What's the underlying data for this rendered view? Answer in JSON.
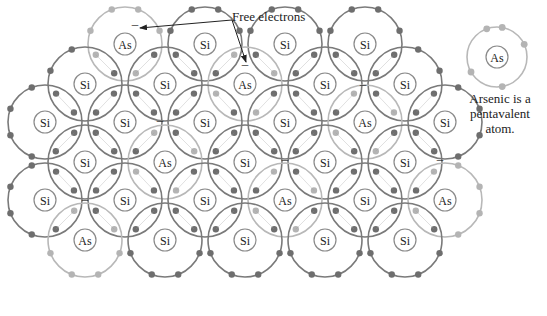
{
  "diagram": {
    "labels": {
      "free_electrons": "Free electrons",
      "caption_line1": "Arsenic is a",
      "caption_line2": "pentavalent",
      "caption_line3": "atom."
    },
    "colors": {
      "si_orbit": "#7a7a7a",
      "as_orbit": "#b8b8b8",
      "si_electron": "#6e6e6e",
      "as_electron": "#b4b4b4",
      "nucleus_stroke": "#8a8a8a",
      "text": "#222222"
    },
    "orbit_radius": 37,
    "nucleus_radius": 11,
    "atoms": [
      {
        "el": "As",
        "x": 125,
        "y": 44
      },
      {
        "el": "Si",
        "x": 205,
        "y": 44
      },
      {
        "el": "Si",
        "x": 285,
        "y": 44
      },
      {
        "el": "Si",
        "x": 365,
        "y": 44
      },
      {
        "el": "Si",
        "x": 85,
        "y": 84
      },
      {
        "el": "Si",
        "x": 165,
        "y": 84
      },
      {
        "el": "As",
        "x": 245,
        "y": 84
      },
      {
        "el": "Si",
        "x": 325,
        "y": 84
      },
      {
        "el": "Si",
        "x": 405,
        "y": 84
      },
      {
        "el": "Si",
        "x": 45,
        "y": 122
      },
      {
        "el": "Si",
        "x": 125,
        "y": 122
      },
      {
        "el": "Si",
        "x": 205,
        "y": 122
      },
      {
        "el": "Si",
        "x": 285,
        "y": 122
      },
      {
        "el": "As",
        "x": 365,
        "y": 122
      },
      {
        "el": "Si",
        "x": 445,
        "y": 122
      },
      {
        "el": "Si",
        "x": 85,
        "y": 162
      },
      {
        "el": "As",
        "x": 165,
        "y": 162
      },
      {
        "el": "Si",
        "x": 245,
        "y": 162
      },
      {
        "el": "Si",
        "x": 325,
        "y": 162
      },
      {
        "el": "Si",
        "x": 405,
        "y": 162
      },
      {
        "el": "Si",
        "x": 45,
        "y": 200
      },
      {
        "el": "Si",
        "x": 125,
        "y": 200
      },
      {
        "el": "Si",
        "x": 205,
        "y": 200
      },
      {
        "el": "As",
        "x": 285,
        "y": 200
      },
      {
        "el": "Si",
        "x": 365,
        "y": 200
      },
      {
        "el": "As",
        "x": 445,
        "y": 200
      },
      {
        "el": "As",
        "x": 85,
        "y": 240
      },
      {
        "el": "Si",
        "x": 165,
        "y": 240
      },
      {
        "el": "Si",
        "x": 245,
        "y": 240
      },
      {
        "el": "Si",
        "x": 325,
        "y": 240
      },
      {
        "el": "Si",
        "x": 405,
        "y": 240
      }
    ],
    "standalone_atom": {
      "el": "As",
      "x": 497,
      "y": 57,
      "r": 30,
      "electrons_deg": [
        -110,
        -80,
        -25,
        150,
        80
      ]
    },
    "free_electron_marks": [
      {
        "symbol": "–",
        "x": 135,
        "y": 28
      },
      {
        "symbol": "–",
        "x": 245,
        "y": 68
      },
      {
        "symbol": "–",
        "x": 160,
        "y": 124
      },
      {
        "symbol": "–",
        "x": 363,
        "y": 88
      },
      {
        "symbol": "–",
        "x": 285,
        "y": 163
      },
      {
        "symbol": "–",
        "x": 440,
        "y": 163
      },
      {
        "symbol": "–",
        "x": 85,
        "y": 203
      }
    ],
    "arrows": [
      {
        "from": [
          232,
          20
        ],
        "to": [
          140,
          28
        ]
      },
      {
        "from": [
          232,
          20
        ],
        "to": [
          246,
          62
        ]
      }
    ]
  }
}
